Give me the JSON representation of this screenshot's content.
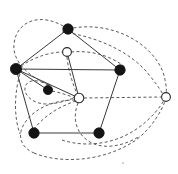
{
  "figure": {
    "width": 178,
    "height": 174,
    "background_color": "#ffffff",
    "solid_edge_color": "#3a3a3a",
    "dashed_edge_color": "#5a5a5a",
    "filled_node_color": "#141414",
    "open_node_fill": "#ffffff",
    "open_node_stroke": "#2a2a2a"
  },
  "chart_data": {
    "type": "diagram",
    "node_count": 9,
    "filled_node_count": 6,
    "open_node_count": 3,
    "nodes": [
      {
        "id": "n1",
        "label": "top",
        "style": "filled",
        "x": 68,
        "y": 29,
        "r": 5.2
      },
      {
        "id": "n2",
        "label": "left",
        "style": "filled",
        "x": 16,
        "y": 69,
        "r": 5.6
      },
      {
        "id": "n3",
        "label": "right",
        "style": "filled",
        "x": 120,
        "y": 70,
        "r": 5.2
      },
      {
        "id": "n4",
        "label": "mid-left",
        "style": "filled",
        "x": 48,
        "y": 90,
        "r": 4.6
      },
      {
        "id": "n5",
        "label": "bottom-left",
        "style": "filled",
        "x": 34,
        "y": 133,
        "r": 5.2
      },
      {
        "id": "n6",
        "label": "bottom-right",
        "style": "filled",
        "x": 99,
        "y": 133,
        "r": 5.2
      },
      {
        "id": "n7",
        "label": "upper-open",
        "style": "open",
        "x": 67,
        "y": 52,
        "r": 4.4
      },
      {
        "id": "n8",
        "label": "center-open",
        "style": "open",
        "x": 79,
        "y": 98,
        "r": 4.8
      },
      {
        "id": "n9",
        "label": "far-right-open",
        "style": "open",
        "x": 166,
        "y": 97,
        "r": 4.4
      }
    ],
    "solid_edges": [
      {
        "from": "n1",
        "to": "n2"
      },
      {
        "from": "n1",
        "to": "n3"
      },
      {
        "from": "n2",
        "to": "n3"
      },
      {
        "from": "n2",
        "to": "n4"
      },
      {
        "from": "n2",
        "to": "n5"
      },
      {
        "from": "n2",
        "to": "n8"
      },
      {
        "from": "n3",
        "to": "n6"
      },
      {
        "from": "n5",
        "to": "n6"
      },
      {
        "from": "n7",
        "to": "n8"
      }
    ],
    "dashed_edges": [
      {
        "from": "n8",
        "to": "n9",
        "shape": "straight"
      },
      {
        "from": "n1",
        "to": "n7",
        "shape": "arc-over-top"
      },
      {
        "from": "n2",
        "to": "n7",
        "shape": "arc"
      },
      {
        "from": "n4",
        "to": "n8",
        "shape": "arc"
      },
      {
        "from": "n4",
        "to": "n2",
        "shape": "loop-left"
      },
      {
        "from": "n5",
        "to": "n9",
        "shape": "long-arc-bottom"
      },
      {
        "from": "n6",
        "to": "n9",
        "shape": "long-arc-bottom"
      },
      {
        "from": "n1",
        "to": "n9",
        "shape": "long-arc-top"
      },
      {
        "from": "n7",
        "to": "n3",
        "shape": "arc"
      },
      {
        "from": "n8",
        "to": "n6",
        "shape": "arc"
      },
      {
        "from": "n8",
        "to": "n5",
        "shape": "arc"
      }
    ],
    "legend": [],
    "xlabel": "",
    "ylabel": ""
  }
}
